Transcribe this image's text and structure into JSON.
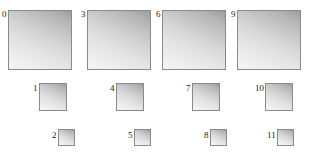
{
  "figure": {
    "name": "gradient-square-grid",
    "background_color": "#ffffff",
    "border_color": "#8a8a8a",
    "label_color": "#1b1b1b",
    "gradient": {
      "direction": "top-right-dark-to-bottom-left-light",
      "dark_color": "#9c9c9c",
      "light_color": "#f6f6f6"
    },
    "columns": 4,
    "rows": 3,
    "row_sizes_px": [
      64,
      28,
      17
    ],
    "squares": [
      {
        "label": "0",
        "size": "lg",
        "row": 1,
        "column": 1,
        "left": 2,
        "top": 10
      },
      {
        "label": "1",
        "size": "md",
        "row": 2,
        "column": 1,
        "left": 33,
        "top": 83
      },
      {
        "label": "2",
        "size": "sm",
        "row": 3,
        "column": 1,
        "left": 52,
        "top": 129
      },
      {
        "label": "3",
        "size": "lg",
        "row": 1,
        "column": 2,
        "left": 81,
        "top": 10
      },
      {
        "label": "4",
        "size": "md",
        "row": 2,
        "column": 2,
        "left": 110,
        "top": 83
      },
      {
        "label": "5",
        "size": "sm",
        "row": 3,
        "column": 2,
        "left": 128,
        "top": 129
      },
      {
        "label": "6",
        "size": "lg",
        "row": 1,
        "column": 3,
        "left": 156,
        "top": 10
      },
      {
        "label": "7",
        "size": "md",
        "row": 2,
        "column": 3,
        "left": 186,
        "top": 83
      },
      {
        "label": "8",
        "size": "sm",
        "row": 3,
        "column": 3,
        "left": 204,
        "top": 129
      },
      {
        "label": "9",
        "size": "lg",
        "row": 1,
        "column": 4,
        "left": 231,
        "top": 10
      },
      {
        "label": "10",
        "size": "md",
        "row": 2,
        "column": 4,
        "left": 255,
        "top": 83
      },
      {
        "label": "11",
        "size": "sm",
        "row": 3,
        "column": 4,
        "left": 267,
        "top": 129
      }
    ]
  }
}
